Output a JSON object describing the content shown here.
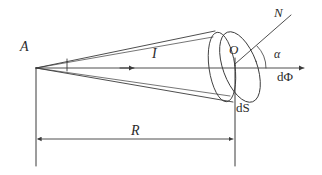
{
  "figure": {
    "background_color": "#ffffff",
    "line_color": "#3a3a3a",
    "label_color": "#2b2b2b",
    "labels": {
      "apex": "A",
      "intensity": "I",
      "center": "O",
      "normal": "N",
      "angle": "α",
      "flux": "dΦ",
      "area_element": "dS",
      "distance": "R"
    },
    "geometry": {
      "apex_point": [
        36,
        68
      ],
      "axis_start": [
        36,
        68
      ],
      "axis_end": [
        306,
        68
      ],
      "axis_arrow_mid": [
        133,
        68
      ],
      "cone_base_center": [
        228,
        68
      ],
      "back_ellipse": {
        "cx": 222,
        "cy": 67,
        "rx": 13,
        "ry": 35,
        "rotate": -8
      },
      "front_ellipse": {
        "cx": 240,
        "cy": 67,
        "rx": 17,
        "ry": 37,
        "rotate": -20
      },
      "normal_line": [
        [
          236,
          62
        ],
        [
          292,
          14
        ]
      ],
      "angle_arc_radius": 30,
      "dimension_line": {
        "y": 139,
        "x1": 36,
        "x2": 235
      },
      "left_extension": {
        "x": 36,
        "y1": 68,
        "y2": 166
      },
      "right_extension": {
        "x": 235,
        "y1": 58,
        "y2": 166
      },
      "small_tick": {
        "x": 67,
        "y1": 59,
        "y2": 71
      }
    }
  }
}
